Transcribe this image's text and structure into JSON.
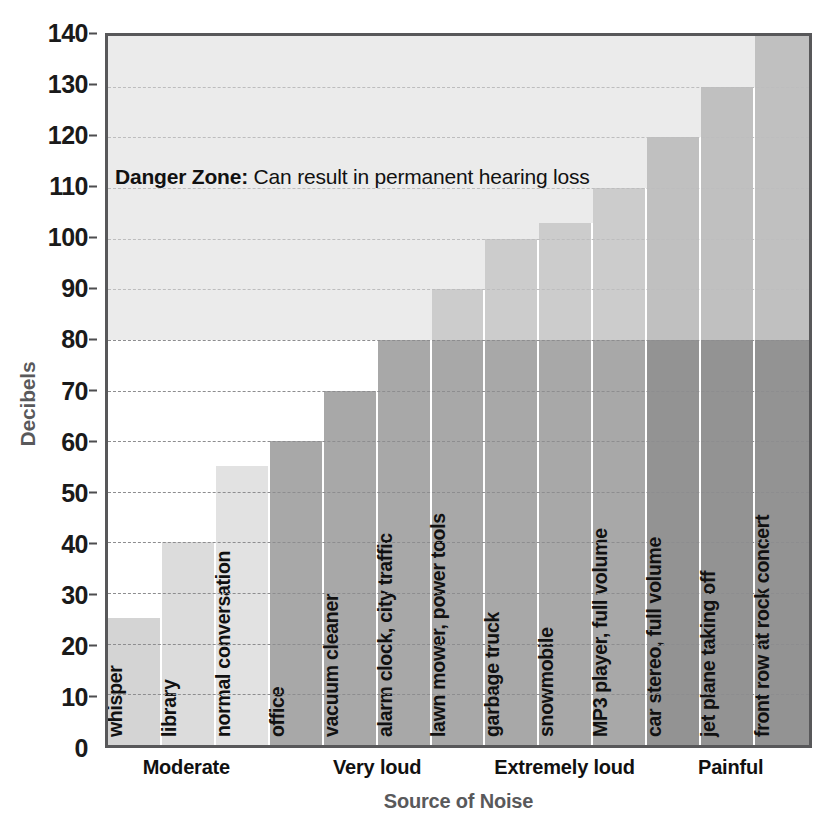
{
  "chart_data": {
    "type": "bar",
    "title": "",
    "xlabel": "Source of Noise",
    "ylabel": "Decibels",
    "ylim": [
      0,
      140
    ],
    "yticks": [
      0,
      10,
      20,
      30,
      40,
      50,
      60,
      70,
      80,
      90,
      100,
      110,
      120,
      130,
      140
    ],
    "ytick_labels": [
      "0",
      "10",
      "20",
      "30",
      "40",
      "50",
      "60",
      "70",
      "80",
      "90",
      "100",
      "110",
      "120",
      "130",
      "140"
    ],
    "grid": true,
    "legend": "none",
    "categories": [
      "whisper",
      "library",
      "normal conversation",
      "office",
      "vacuum cleaner",
      "alarm clock, city traffic",
      "lawn mower, power tools",
      "garbage truck",
      "snowmobile",
      "MP3 player, full volume",
      "car stereo, full volume",
      "jet plane taking off",
      "front row at rock concert"
    ],
    "values": [
      25,
      40,
      55,
      60,
      70,
      80,
      90,
      100,
      103,
      110,
      120,
      130,
      140
    ],
    "bars": [
      {
        "label": "whisper",
        "value": 25,
        "group": "Moderate",
        "color": "#d4d4d4"
      },
      {
        "label": "library",
        "value": 40,
        "group": "Moderate",
        "color": "#dcdcdc"
      },
      {
        "label": "normal conversation",
        "value": 55,
        "group": "Moderate",
        "color": "#e2e2e2"
      },
      {
        "label": "office",
        "value": 60,
        "group": "Very loud",
        "color": "#a8a8a8"
      },
      {
        "label": "vacuum cleaner",
        "value": 70,
        "group": "Very loud",
        "color": "#a8a8a8"
      },
      {
        "label": "alarm clock, city traffic",
        "value": 80,
        "group": "Very loud",
        "color": "#a8a8a8"
      },
      {
        "label": "lawn mower, power tools",
        "value": 90,
        "group": "Extremely loud",
        "color": "#a8a8a8"
      },
      {
        "label": "garbage truck",
        "value": 100,
        "group": "Extremely loud",
        "color": "#a8a8a8"
      },
      {
        "label": "snowmobile",
        "value": 103,
        "group": "Extremely loud",
        "color": "#a8a8a8"
      },
      {
        "label": "MP3 player, full volume",
        "value": 110,
        "group": "Extremely loud",
        "color": "#a8a8a8"
      },
      {
        "label": "car stereo, full volume",
        "value": 120,
        "group": "Painful",
        "color": "#939393"
      },
      {
        "label": "jet plane taking off",
        "value": 130,
        "group": "Painful",
        "color": "#939393"
      },
      {
        "label": "front row at rock concert",
        "value": 140,
        "group": "Painful",
        "color": "#939393"
      }
    ],
    "groups": [
      {
        "label": "Moderate",
        "center_pct": 11.5
      },
      {
        "label": "Very loud",
        "center_pct": 38.5
      },
      {
        "label": "Extremely loud",
        "center_pct": 65.0
      },
      {
        "label": "Painful",
        "center_pct": 88.5
      }
    ],
    "annotations": [
      {
        "name": "danger-zone-note",
        "bold_prefix": "Danger Zone:",
        "text": " Can result in permanent hearing loss",
        "at_decibels_range": [
          80,
          140
        ]
      }
    ],
    "shaded_region": {
      "name": "Danger Zone",
      "from": 80,
      "to": 140,
      "color": "#dcdcdc"
    },
    "colors": {
      "axis": "#58585a",
      "gridline": "#8d8d8f",
      "axis_title": "#59595b",
      "tick_label": "#1a1a1a",
      "danger_band": "#dcdcdc"
    }
  }
}
